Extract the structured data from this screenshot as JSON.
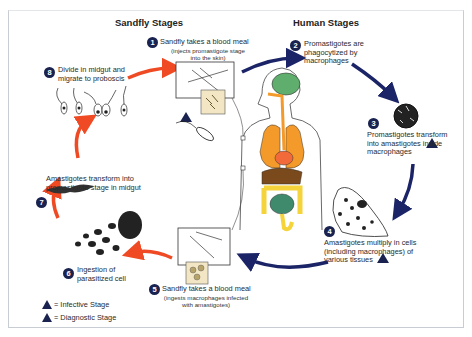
{
  "headers": {
    "sandfly": "Sandfly Stages",
    "human": "Human Stages"
  },
  "stages": [
    {
      "num": "1",
      "title": "Sandfly takes a blood meal",
      "detail": "(injects promastigote stage into the skin)",
      "marker": "infective"
    },
    {
      "num": "2",
      "title": "Promastigotes are phagocytized by macrophages"
    },
    {
      "num": "3",
      "title": "Promastigotes transform into amastigotes inside macrophages",
      "marker": "diagnostic"
    },
    {
      "num": "4",
      "title": "Amastigotes multiply in cells (including macrophages) of various tissues",
      "marker": "diagnostic"
    },
    {
      "num": "5",
      "title": "Sandfly takes a blood meal",
      "detail": "(ingests macrophages infected with amastigotes)"
    },
    {
      "num": "6",
      "title": "Ingestion of parasitized cell"
    },
    {
      "num": "7",
      "title": "Amastigotes transform into promastigote stage in midgut"
    },
    {
      "num": "8",
      "title": "Divide in midgut and migrate to proboscis"
    }
  ],
  "legend": [
    {
      "symbol": "i",
      "label": "= Infective Stage"
    },
    {
      "symbol": "d",
      "label": "= Diagnostic Stage"
    }
  ],
  "colors": {
    "sandfly_arrow": "#ef4a23",
    "human_arrow": "#1b2466",
    "marker": "#1a2350",
    "brain": "#5fae6e",
    "lungs": "#f39a2b",
    "heart": "#f26a3a",
    "colon": "#f5d33a",
    "intestine": "#3f8a6d",
    "liver": "#7a4a1c"
  }
}
